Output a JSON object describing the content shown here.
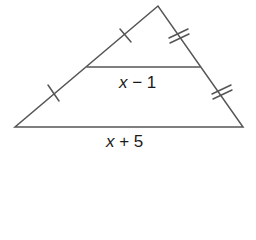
{
  "diagram": {
    "type": "triangle-midsegment",
    "midsegment_label_var": "x",
    "midsegment_label_rest": " − 1",
    "base_label_var": "x",
    "base_label_rest": " + 5",
    "tick_marks": {
      "left_side": "single tick on each half",
      "right_side": "double tick on each half"
    },
    "colors": {
      "stroke": "#555555",
      "text": "#1a1a1a"
    }
  }
}
